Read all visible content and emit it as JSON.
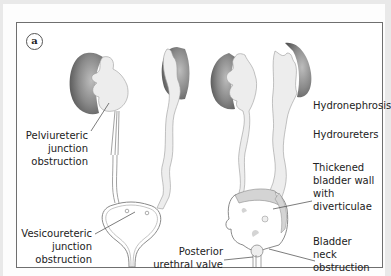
{
  "figure": {
    "panel_label": "a",
    "labels": {
      "pelviureteric": "Pelviureteric junction obstruction",
      "vesicoureteric": "Vesicoureteric junction obstruction",
      "hydronephrosis": "Hydronephrosis",
      "hydroureters": "Hydroureters",
      "thickened_bladder": "Thickened bladder wall with diverticulae",
      "posterior_urethral_valve": "Posterior urethral valve",
      "bladder_neck": "Bladder neck obstruction"
    },
    "label_lines": {
      "pelviureteric": [
        "Pelviureteric",
        "junction",
        "obstruction"
      ],
      "vesicoureteric": [
        "Vesicoureteric",
        "junction",
        "obstruction"
      ],
      "thickened": [
        "Thickened",
        "bladder wall",
        "with",
        "diverticulae"
      ],
      "posterior": [
        "Posterior",
        "urethral valve"
      ],
      "bladder_neck": [
        "Bladder",
        "neck",
        "obstruction"
      ]
    },
    "colors": {
      "kidney_cortex": "#707070",
      "kidney_pelvis": "#ededed",
      "bladder_wall": "#d4d4d4",
      "outline": "#8a8a8a",
      "frame": "#6f6f6f"
    }
  }
}
